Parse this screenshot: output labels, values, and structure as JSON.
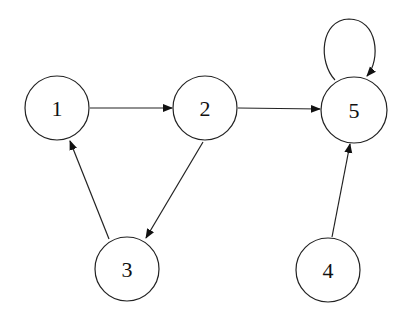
{
  "diagram": {
    "type": "directed-graph",
    "nodes": [
      {
        "id": "1",
        "label": "1",
        "cx": 57,
        "cy": 108,
        "r": 32
      },
      {
        "id": "2",
        "label": "2",
        "cx": 205,
        "cy": 108,
        "r": 32
      },
      {
        "id": "5",
        "label": "5",
        "cx": 354,
        "cy": 110,
        "r": 33
      },
      {
        "id": "3",
        "label": "3",
        "cx": 127,
        "cy": 269,
        "r": 32
      },
      {
        "id": "4",
        "label": "4",
        "cx": 328,
        "cy": 270,
        "r": 32
      }
    ],
    "edges": [
      {
        "from": "1",
        "to": "2"
      },
      {
        "from": "2",
        "to": "5"
      },
      {
        "from": "2",
        "to": "3"
      },
      {
        "from": "3",
        "to": "1"
      },
      {
        "from": "4",
        "to": "5"
      },
      {
        "from": "5",
        "to": "5",
        "self_loop": true
      }
    ]
  }
}
